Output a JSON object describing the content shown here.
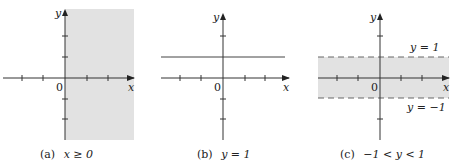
{
  "colors": {
    "background": "#ffffff",
    "shade": "#e2e2e2",
    "axis": "#333333",
    "line": "#444444",
    "dashed": "#666666"
  },
  "panels": [
    {
      "id": "a",
      "caption_prefix": "(a)",
      "caption_math": "x ≥ 0",
      "x_label": "x",
      "y_label": "y",
      "origin_label": "0",
      "origin": {
        "x": 65,
        "y": 78
      },
      "x_axis": {
        "from": 3,
        "to": 134
      },
      "y_axis": {
        "from": 9,
        "to": 140
      },
      "x_ticks": [
        22,
        43,
        87,
        108
      ],
      "y_ticks": [
        36,
        57,
        99,
        119
      ],
      "shade": {
        "x": 65,
        "y": 9,
        "w": 69,
        "h": 131
      },
      "caption_pos": {
        "x": 40,
        "y": 158
      }
    },
    {
      "id": "b",
      "caption_prefix": "(b)",
      "caption_math": "y = 1",
      "x_label": "x",
      "y_label": "y",
      "origin_label": "0",
      "origin": {
        "x": 223,
        "y": 78
      },
      "x_axis": {
        "from": 161,
        "to": 289
      },
      "y_axis": {
        "from": 13,
        "to": 140
      },
      "x_ticks": [
        180,
        201,
        245,
        265
      ],
      "y_ticks": [
        36,
        99,
        119
      ],
      "hline": {
        "y": 57,
        "x1": 161,
        "x2": 285
      },
      "caption_pos": {
        "x": 197,
        "y": 158
      }
    },
    {
      "id": "c",
      "caption_prefix": "(c)",
      "caption_math": "−1 < y < 1",
      "x_label": "x",
      "y_label": "y",
      "origin_label": "0",
      "origin": {
        "x": 380,
        "y": 78
      },
      "x_axis": {
        "from": 318,
        "to": 449
      },
      "y_axis": {
        "from": 13,
        "to": 140
      },
      "x_ticks": [
        337,
        358,
        401,
        422
      ],
      "y_ticks": [
        36,
        119
      ],
      "band": {
        "x": 318,
        "y": 57,
        "w": 131,
        "h": 41
      },
      "upper_label": "y = 1",
      "lower_label": "y = −1",
      "caption_pos": {
        "x": 340,
        "y": 158
      }
    }
  ]
}
